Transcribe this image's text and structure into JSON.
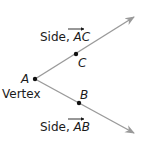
{
  "diagram": {
    "vertex": {
      "point": "A",
      "label": "Vertex"
    },
    "sides": [
      {
        "label_prefix": "Side, ",
        "ray": "AC",
        "point": "C"
      },
      {
        "label_prefix": "Side, ",
        "ray": "AB",
        "point": "B"
      }
    ],
    "colors": {
      "ray": "#9a9a9a",
      "point": "#111111",
      "text": "#1a1a1a"
    }
  }
}
